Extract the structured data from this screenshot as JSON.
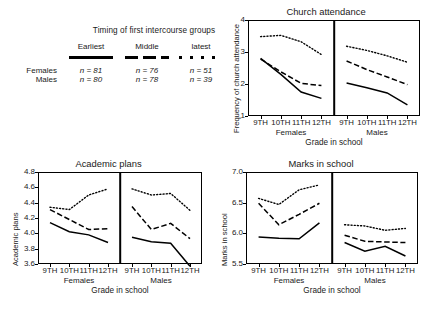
{
  "legend": {
    "title": "Timing of first intercourse groups",
    "group_headers": [
      "Earliest",
      "Middle",
      "latest"
    ],
    "group_styles": [
      "solid",
      "dashed",
      "dotted"
    ],
    "rows": [
      {
        "label": "Females",
        "values": [
          "n = 81",
          "n = 76",
          "n = 51"
        ]
      },
      {
        "label": "Males",
        "values": [
          "n = 80",
          "n = 78",
          "n = 39"
        ]
      }
    ]
  },
  "shared": {
    "xlabel": "Grade in school",
    "panels": [
      "Females",
      "Males"
    ],
    "xticks": [
      "9TH",
      "10TH",
      "11TH",
      "12TH"
    ]
  },
  "chart_data": [
    {
      "type": "line",
      "id": "church",
      "title": "Church attendance",
      "xlabel": "Grade in school",
      "ylabel": "Frequency of church attendance",
      "ylim": [
        1,
        4
      ],
      "yticks": [
        "1",
        "2",
        "3",
        "4"
      ],
      "grid": false,
      "legend_position": "external",
      "x": [
        "9TH",
        "10TH",
        "11TH",
        "12TH"
      ],
      "panels": [
        {
          "name": "Females",
          "series": [
            {
              "name": "Earliest",
              "style": "solid",
              "values": [
                2.8,
                2.3,
                1.75,
                1.55
              ]
            },
            {
              "name": "Middle",
              "style": "dashed",
              "values": [
                2.78,
                2.38,
                2.02,
                1.95
              ]
            },
            {
              "name": "latest",
              "style": "dotted",
              "values": [
                3.48,
                3.52,
                3.32,
                2.92
              ]
            }
          ]
        },
        {
          "name": "Males",
          "series": [
            {
              "name": "Earliest",
              "style": "solid",
              "values": [
                2.03,
                1.88,
                1.72,
                1.35
              ]
            },
            {
              "name": "Middle",
              "style": "dashed",
              "values": [
                2.72,
                2.45,
                2.22,
                1.98
              ]
            },
            {
              "name": "latest",
              "style": "dotted",
              "values": [
                3.18,
                3.05,
                2.88,
                2.68
              ]
            }
          ]
        }
      ]
    },
    {
      "type": "line",
      "id": "academic",
      "title": "Academic plans",
      "xlabel": "Grade in school",
      "ylabel": "Academic plans",
      "ylim": [
        3.6,
        4.8
      ],
      "yticks": [
        "3.6",
        "3.8",
        "4.0",
        "4.2",
        "4.4",
        "4.6",
        "4.8"
      ],
      "grid": false,
      "legend_position": "external",
      "x": [
        "9TH",
        "10TH",
        "11TH",
        "12TH"
      ],
      "panels": [
        {
          "name": "Females",
          "series": [
            {
              "name": "Earliest",
              "style": "solid",
              "values": [
                4.14,
                4.02,
                3.98,
                3.88
              ]
            },
            {
              "name": "Middle",
              "style": "dashed",
              "values": [
                4.31,
                4.18,
                4.05,
                4.06
              ]
            },
            {
              "name": "latest",
              "style": "dotted",
              "values": [
                4.34,
                4.31,
                4.5,
                4.58
              ]
            }
          ]
        },
        {
          "name": "Males",
          "series": [
            {
              "name": "Earliest",
              "style": "solid",
              "values": [
                3.95,
                3.89,
                3.87,
                3.57
              ]
            },
            {
              "name": "Middle",
              "style": "dashed",
              "values": [
                4.35,
                4.05,
                4.13,
                3.93
              ]
            },
            {
              "name": "latest",
              "style": "dotted",
              "values": [
                4.58,
                4.5,
                4.52,
                4.3
              ]
            }
          ]
        }
      ]
    },
    {
      "type": "line",
      "id": "marks",
      "title": "Marks in school",
      "xlabel": "Grade in school",
      "ylabel": "Marks in school",
      "ylim": [
        5.5,
        7.0
      ],
      "yticks": [
        "5.5",
        "6.0",
        "6.5",
        "7.0"
      ],
      "grid": false,
      "legend_position": "external",
      "x": [
        "9TH",
        "10TH",
        "11TH",
        "12TH"
      ],
      "panels": [
        {
          "name": "Females",
          "series": [
            {
              "name": "Earliest",
              "style": "solid",
              "values": [
                5.94,
                5.92,
                5.91,
                6.17
              ]
            },
            {
              "name": "Middle",
              "style": "dashed",
              "values": [
                6.49,
                6.14,
                6.31,
                6.49
              ]
            },
            {
              "name": "latest",
              "style": "dotted",
              "values": [
                6.57,
                6.47,
                6.71,
                6.79
              ]
            }
          ]
        },
        {
          "name": "Males",
          "series": [
            {
              "name": "Earliest",
              "style": "solid",
              "values": [
                5.85,
                5.71,
                5.79,
                5.63
              ]
            },
            {
              "name": "Middle",
              "style": "dashed",
              "values": [
                5.97,
                5.87,
                5.86,
                5.85
              ]
            },
            {
              "name": "latest",
              "style": "dotted",
              "values": [
                6.14,
                6.12,
                6.05,
                6.08
              ]
            }
          ]
        }
      ]
    }
  ]
}
